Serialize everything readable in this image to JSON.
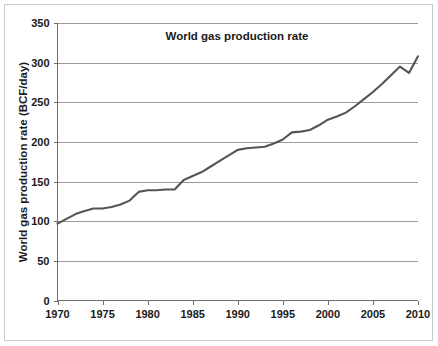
{
  "figure": {
    "background_color": "#ffffff",
    "border_color": "#c9c9c9"
  },
  "chart_data": {
    "type": "line",
    "title": "World gas production rate",
    "xlabel": "",
    "ylabel": "World gas production rate (BCF/day)",
    "xlim": [
      1970,
      2010
    ],
    "ylim": [
      0,
      350
    ],
    "grid": "horizontal",
    "legend": "none",
    "line_color": "#555555",
    "gridline_color": "#9a9a9a",
    "axis_color": "#6e6e6e",
    "x_ticks": [
      1970,
      1975,
      1980,
      1985,
      1990,
      1995,
      2000,
      2005,
      2010
    ],
    "x_tick_labels": [
      "1970",
      "1975",
      "1980",
      "1985",
      "1990",
      "1995",
      "2000",
      "2005",
      "2010"
    ],
    "y_ticks": [
      0,
      50,
      100,
      150,
      200,
      250,
      300,
      350
    ],
    "y_tick_labels": [
      "0",
      "50",
      "100",
      "150",
      "200",
      "250",
      "300",
      "350"
    ],
    "series": [
      {
        "name": "World gas production rate",
        "x": [
          1970,
          1971,
          1972,
          1973,
          1974,
          1975,
          1976,
          1977,
          1978,
          1979,
          1980,
          1981,
          1982,
          1983,
          1984,
          1985,
          1986,
          1987,
          1988,
          1989,
          1990,
          1991,
          1992,
          1993,
          1994,
          1995,
          1996,
          1997,
          1998,
          1999,
          2000,
          2001,
          2002,
          2003,
          2004,
          2005,
          2006,
          2007,
          2008,
          2009,
          2010
        ],
        "values": [
          97,
          103,
          109,
          113,
          116,
          116,
          118,
          121,
          126,
          137,
          139,
          139,
          140,
          140,
          152,
          157,
          162,
          169,
          176,
          183,
          190,
          192,
          193,
          194,
          198,
          203,
          212,
          213,
          215,
          221,
          228,
          232,
          237,
          245,
          254,
          263,
          273,
          284,
          295,
          287,
          308
        ]
      }
    ]
  }
}
